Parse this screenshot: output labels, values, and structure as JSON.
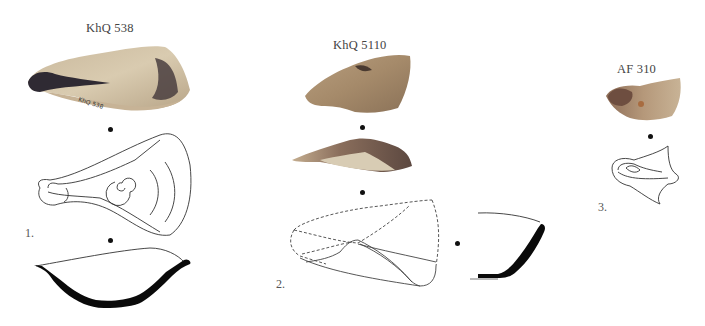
{
  "figure": {
    "objects": [
      {
        "id": 1,
        "title": "KhQ 538",
        "number_label": "1.",
        "inscription": "KhQ 538"
      },
      {
        "id": 2,
        "title": "KhQ 5110",
        "number_label": "2.",
        "inscription": "KhQ 5110"
      },
      {
        "id": 3,
        "title": "AF 310",
        "number_label": "3."
      }
    ]
  },
  "colors": {
    "background": "#ffffff",
    "clay_light": "#d8c7aa",
    "clay_mid": "#b89c78",
    "clay_dark": "#6e5a4a",
    "soot": "#2a2730",
    "section_fill": "#0a0a0a",
    "line": "#333333"
  }
}
